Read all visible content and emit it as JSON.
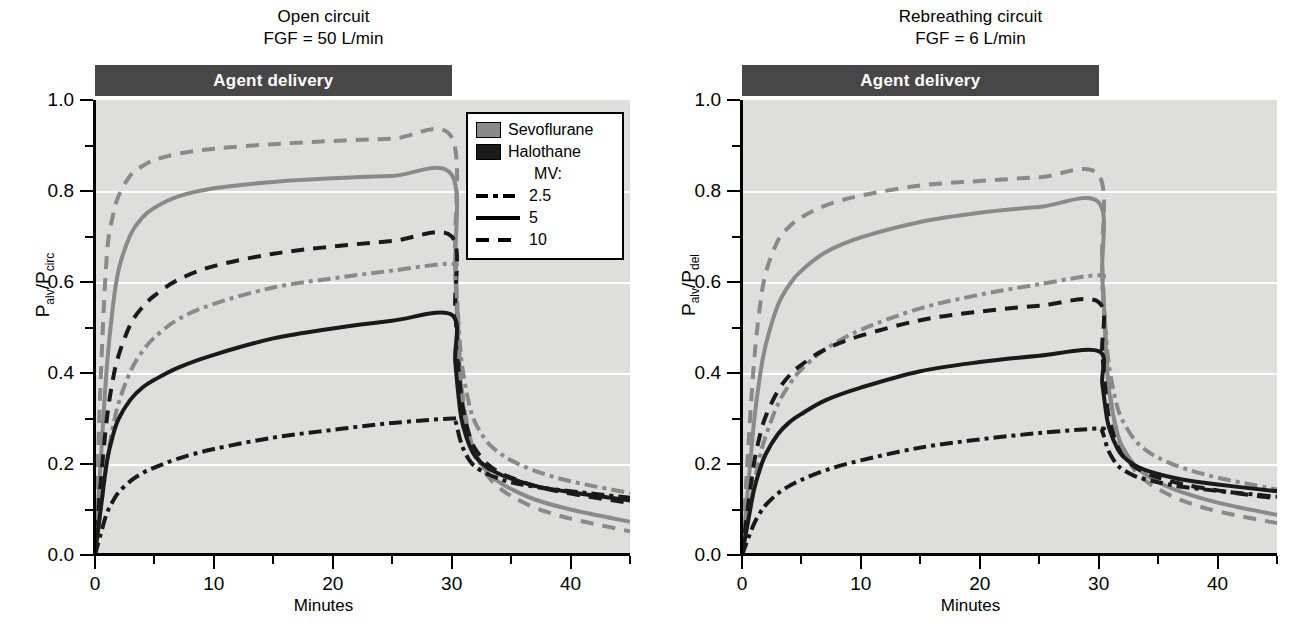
{
  "figure": {
    "background": "#ffffff",
    "plot_background": "#dededd",
    "sevoflurane_color": "#8a8a8a",
    "halothane_color": "#1a1a1a",
    "delivery_bar_color": "#474747"
  },
  "panels": [
    {
      "id": "open-circuit",
      "title_line1": "Open circuit",
      "title_line2": "FGF = 50 L/min",
      "delivery_label": "Agent delivery",
      "ylabel_main": "P",
      "ylabel_sub1": "alv",
      "ylabel_slash": "/P",
      "ylabel_sub2": "circ",
      "xlabel": "Minutes"
    },
    {
      "id": "rebreathing-circuit",
      "title_line1": "Rebreathing circuit",
      "title_line2": "FGF = 6 L/min",
      "delivery_label": "Agent delivery",
      "ylabel_main": "P",
      "ylabel_sub1": "alv",
      "ylabel_slash": "/P",
      "ylabel_sub2": "del",
      "xlabel": "Minutes"
    }
  ],
  "legend": {
    "agents": [
      {
        "label": "Sevoflurane",
        "color": "#8a8a8a"
      },
      {
        "label": "Halothane",
        "color": "#1a1a1a"
      }
    ],
    "mv_header": "MV:",
    "mv_entries": [
      {
        "label": "2.5",
        "style": "dashdot"
      },
      {
        "label": "5",
        "style": "solid"
      },
      {
        "label": "10",
        "style": "dashed"
      }
    ]
  },
  "axes": {
    "y_ticks": [
      "0.0",
      "0.2",
      "0.4",
      "0.6",
      "0.8",
      "1.0"
    ],
    "y_tick_values": [
      0.0,
      0.2,
      0.4,
      0.6,
      0.8,
      1.0
    ],
    "y_minor_values": [
      0.1,
      0.3,
      0.5,
      0.7,
      0.9
    ],
    "x_ticks": [
      "0",
      "10",
      "20",
      "30",
      "40"
    ],
    "x_tick_values": [
      0,
      10,
      20,
      30,
      40
    ],
    "x_minor_values": [
      5,
      15,
      25,
      35,
      45
    ],
    "xlim": [
      0,
      45
    ],
    "ylim": [
      0,
      1.0
    ],
    "gridlines_at": [
      0.2,
      0.4,
      0.6,
      0.8
    ]
  },
  "annotations": {
    "delivery_start_min": 0,
    "delivery_end_min": 30
  },
  "chart_data": [
    {
      "type": "line",
      "title": "Open circuit — FGF = 50 L/min",
      "xlabel": "Minutes",
      "ylabel": "Palv/Pcirc",
      "xlim": [
        0,
        45
      ],
      "ylim": [
        0,
        1.0
      ],
      "grid": true,
      "legend_position": "upper-right",
      "x": [
        0,
        0.5,
        1,
        1.5,
        2,
        3,
        4,
        5,
        7,
        10,
        15,
        20,
        25,
        30,
        30.3,
        30.7,
        31,
        31.5,
        32,
        33,
        34,
        35,
        37,
        40,
        45
      ],
      "series": [
        {
          "name": "Sevoflurane MV 10",
          "agent": "Sevoflurane",
          "mv": 10,
          "color": "#8a8a8a",
          "style": "dashed",
          "values": [
            0.0,
            0.4,
            0.66,
            0.745,
            0.79,
            0.835,
            0.855,
            0.868,
            0.882,
            0.893,
            0.903,
            0.91,
            0.915,
            0.918,
            0.66,
            0.42,
            0.335,
            0.262,
            0.222,
            0.175,
            0.148,
            0.13,
            0.104,
            0.08,
            0.052
          ]
        },
        {
          "name": "Sevoflurane MV 5",
          "agent": "Sevoflurane",
          "mv": 5,
          "color": "#8a8a8a",
          "style": "solid",
          "values": [
            0.0,
            0.215,
            0.415,
            0.545,
            0.628,
            0.705,
            0.742,
            0.763,
            0.788,
            0.806,
            0.82,
            0.828,
            0.833,
            0.836,
            0.62,
            0.4,
            0.325,
            0.258,
            0.222,
            0.182,
            0.16,
            0.145,
            0.122,
            0.1,
            0.073
          ]
        },
        {
          "name": "Halothane MV 10",
          "agent": "Halothane",
          "mv": 10,
          "color": "#1a1a1a",
          "style": "dashed",
          "values": [
            0.0,
            0.165,
            0.3,
            0.385,
            0.44,
            0.508,
            0.545,
            0.57,
            0.605,
            0.635,
            0.662,
            0.678,
            0.69,
            0.7,
            0.54,
            0.375,
            0.315,
            0.262,
            0.232,
            0.2,
            0.182,
            0.17,
            0.152,
            0.135,
            0.114
          ]
        },
        {
          "name": "Sevoflurane MV 2.5",
          "agent": "Sevoflurane",
          "mv": 2.5,
          "color": "#8a8a8a",
          "style": "dashdot",
          "values": [
            0.0,
            0.105,
            0.205,
            0.28,
            0.335,
            0.405,
            0.448,
            0.478,
            0.518,
            0.552,
            0.588,
            0.608,
            0.625,
            0.64,
            0.615,
            0.462,
            0.395,
            0.328,
            0.29,
            0.248,
            0.225,
            0.208,
            0.185,
            0.162,
            0.136
          ]
        },
        {
          "name": "Halothane MV 5",
          "agent": "Halothane",
          "mv": 5,
          "color": "#1a1a1a",
          "style": "solid",
          "values": [
            0.0,
            0.105,
            0.205,
            0.262,
            0.3,
            0.342,
            0.368,
            0.385,
            0.412,
            0.44,
            0.476,
            0.498,
            0.515,
            0.528,
            0.425,
            0.32,
            0.28,
            0.24,
            0.216,
            0.192,
            0.178,
            0.168,
            0.152,
            0.138,
            0.12
          ]
        },
        {
          "name": "Halothane MV 2.5",
          "agent": "Halothane",
          "mv": 2.5,
          "color": "#1a1a1a",
          "style": "dashdot",
          "values": [
            0.0,
            0.048,
            0.092,
            0.118,
            0.138,
            0.163,
            0.18,
            0.192,
            0.212,
            0.233,
            0.258,
            0.275,
            0.29,
            0.3,
            0.295,
            0.255,
            0.232,
            0.208,
            0.194,
            0.178,
            0.168,
            0.16,
            0.15,
            0.14,
            0.126
          ]
        }
      ]
    },
    {
      "type": "line",
      "title": "Rebreathing circuit — FGF = 6 L/min",
      "xlabel": "Minutes",
      "ylabel": "Palv/Pdel",
      "xlim": [
        0,
        45
      ],
      "ylim": [
        0,
        1.0
      ],
      "grid": true,
      "legend_position": "upper-right",
      "x": [
        0,
        0.5,
        1,
        1.5,
        2,
        3,
        4,
        5,
        7,
        10,
        15,
        20,
        25,
        30,
        30.3,
        30.7,
        31,
        31.5,
        32,
        33,
        34,
        35,
        37,
        40,
        45
      ],
      "series": [
        {
          "name": "Sevoflurane MV 10",
          "agent": "Sevoflurane",
          "mv": 10,
          "color": "#8a8a8a",
          "style": "dashed",
          "values": [
            0.0,
            0.225,
            0.42,
            0.545,
            0.62,
            0.69,
            0.722,
            0.742,
            0.768,
            0.79,
            0.812,
            0.822,
            0.83,
            0.835,
            0.64,
            0.425,
            0.345,
            0.272,
            0.232,
            0.188,
            0.162,
            0.145,
            0.12,
            0.096,
            0.07
          ]
        },
        {
          "name": "Sevoflurane MV 5",
          "agent": "Sevoflurane",
          "mv": 5,
          "color": "#8a8a8a",
          "style": "solid",
          "values": [
            0.0,
            0.145,
            0.29,
            0.392,
            0.462,
            0.548,
            0.595,
            0.625,
            0.665,
            0.698,
            0.732,
            0.752,
            0.765,
            0.775,
            0.615,
            0.412,
            0.34,
            0.275,
            0.238,
            0.198,
            0.176,
            0.16,
            0.138,
            0.115,
            0.088
          ]
        },
        {
          "name": "Sevoflurane MV 2.5",
          "agent": "Sevoflurane",
          "mv": 2.5,
          "color": "#8a8a8a",
          "style": "dashdot",
          "values": [
            0.0,
            0.078,
            0.155,
            0.215,
            0.262,
            0.33,
            0.375,
            0.408,
            0.452,
            0.495,
            0.542,
            0.572,
            0.595,
            0.615,
            0.59,
            0.455,
            0.395,
            0.332,
            0.296,
            0.254,
            0.23,
            0.214,
            0.192,
            0.17,
            0.144
          ]
        },
        {
          "name": "Halothane MV 10",
          "agent": "Halothane",
          "mv": 10,
          "color": "#1a1a1a",
          "style": "dashed",
          "values": [
            0.0,
            0.105,
            0.2,
            0.262,
            0.305,
            0.36,
            0.395,
            0.418,
            0.452,
            0.482,
            0.516,
            0.535,
            0.548,
            0.556,
            0.445,
            0.33,
            0.288,
            0.245,
            0.22,
            0.194,
            0.18,
            0.17,
            0.156,
            0.142,
            0.124
          ]
        },
        {
          "name": "Halothane MV 5",
          "agent": "Halothane",
          "mv": 5,
          "color": "#1a1a1a",
          "style": "solid",
          "values": [
            0.0,
            0.072,
            0.142,
            0.188,
            0.222,
            0.265,
            0.292,
            0.31,
            0.34,
            0.368,
            0.404,
            0.424,
            0.438,
            0.448,
            0.378,
            0.3,
            0.27,
            0.238,
            0.218,
            0.198,
            0.186,
            0.178,
            0.166,
            0.155,
            0.14
          ]
        },
        {
          "name": "Halothane MV 2.5",
          "agent": "Halothane",
          "mv": 2.5,
          "color": "#1a1a1a",
          "style": "dashdot",
          "values": [
            0.0,
            0.035,
            0.068,
            0.092,
            0.11,
            0.135,
            0.152,
            0.165,
            0.186,
            0.208,
            0.236,
            0.254,
            0.268,
            0.278,
            0.272,
            0.238,
            0.22,
            0.2,
            0.188,
            0.174,
            0.166,
            0.16,
            0.15,
            0.141,
            0.128
          ]
        }
      ]
    }
  ]
}
